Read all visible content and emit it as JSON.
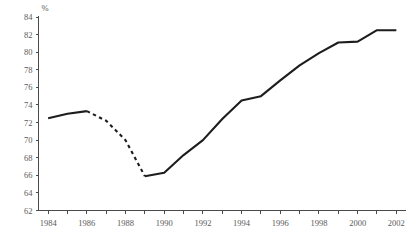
{
  "chart_data": {
    "type": "line",
    "title": "",
    "xlabel": "",
    "ylabel": "%",
    "ylim": [
      62,
      84
    ],
    "xlim": [
      1983.5,
      2002.5
    ],
    "ytick_step": 2,
    "yticks": [
      62,
      64,
      66,
      68,
      70,
      72,
      74,
      76,
      78,
      80,
      82,
      84
    ],
    "ytick_labels": [
      "62",
      "64",
      "66",
      "68",
      "70",
      "72",
      "74",
      "76",
      "78",
      "80",
      "82",
      "84"
    ],
    "xticks_major": [
      1984,
      1986,
      1988,
      1990,
      1992,
      1994,
      1996,
      1998,
      2000,
      2002
    ],
    "xtick_labels": [
      "1984",
      "1986",
      "1988",
      "1990",
      "1992",
      "1994",
      "1996",
      "1998",
      "2000",
      "2002"
    ],
    "xticks_minor": [
      1985,
      1987,
      1989,
      1991,
      1993,
      1995,
      1997,
      1999,
      2001
    ],
    "grid": false,
    "legend": null,
    "series": [
      {
        "name": "percent",
        "color": "#1d1d1d",
        "x": [
          1984,
          1985,
          1986,
          1987,
          1988,
          1989,
          1990,
          1991,
          1992,
          1993,
          1994,
          1995,
          1996,
          1997,
          1998,
          1999,
          2000,
          2001,
          2002
        ],
        "values": [
          72.5,
          73.0,
          73.3,
          72.2,
          70.0,
          65.9,
          66.3,
          68.3,
          70.0,
          72.4,
          74.5,
          75.0,
          76.8,
          78.5,
          79.9,
          81.1,
          81.2,
          82.5,
          82.5
        ],
        "segments": [
          {
            "style": "solid",
            "from_index": 0,
            "to_index": 2
          },
          {
            "style": "dashed",
            "from_index": 2,
            "to_index": 5
          },
          {
            "style": "solid",
            "from_index": 5,
            "to_index": 18
          }
        ]
      }
    ]
  },
  "axis": {
    "unit_label": "%"
  }
}
